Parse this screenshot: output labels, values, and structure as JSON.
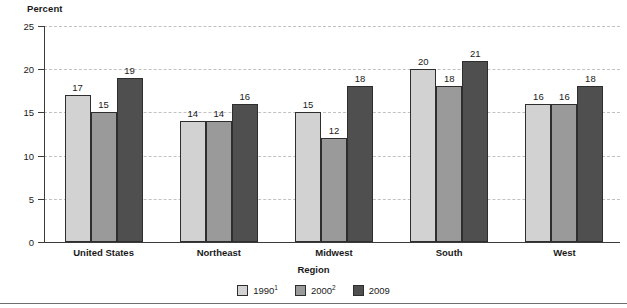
{
  "chart_data": {
    "type": "bar",
    "title": "",
    "ylabel": "Percent",
    "xlabel": "Region",
    "ylim": [
      0,
      25
    ],
    "yticks": [
      0,
      5,
      10,
      15,
      20,
      25
    ],
    "grid": true,
    "legend_position": "bottom",
    "categories": [
      "United States",
      "Northeast",
      "Midwest",
      "South",
      "West"
    ],
    "series": [
      {
        "name": "1990",
        "footnote": "1",
        "legend_label": "1990",
        "color": "#d2d2d2",
        "values": [
          17,
          14,
          15,
          20,
          16
        ],
        "labels": [
          "17",
          "14",
          "15",
          "20",
          "16"
        ]
      },
      {
        "name": "2000",
        "footnote": "2",
        "legend_label": "2000",
        "color": "#9a9a9a",
        "values": [
          15,
          14,
          12,
          18,
          16
        ],
        "labels": [
          "15",
          "14",
          "12",
          "18",
          "16"
        ]
      },
      {
        "name": "2009",
        "footnote": "",
        "legend_label": "2009",
        "color": "#4f4f4f",
        "values": [
          19,
          16,
          18,
          21,
          18
        ],
        "labels": [
          "19",
          "16",
          "18",
          "21",
          "18"
        ]
      }
    ],
    "ytick_labels": [
      "0",
      "5",
      "10",
      "15",
      "20",
      "25"
    ],
    "axis_color": "#3b3b3b",
    "gridline_color": "#c2c2c2",
    "bar_border_color": "#2e2e2e"
  }
}
